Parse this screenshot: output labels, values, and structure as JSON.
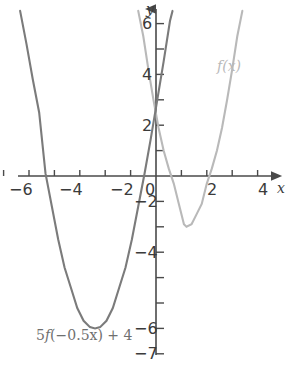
{
  "chart_data": {
    "type": "line",
    "title": "",
    "subtitle": "",
    "xlabel": "x",
    "ylabel": "y",
    "xlim": [
      -6.8,
      4.9
    ],
    "ylim": [
      -7.2,
      6.6
    ],
    "grid": false,
    "legend_position": "inline-annotation",
    "x_ticks": [
      -6,
      -5,
      -4,
      -3,
      -2,
      -1,
      0,
      1,
      2,
      3,
      4
    ],
    "x_tick_labels": [
      "−6",
      "",
      "−4",
      "",
      "−2",
      "",
      "0",
      "",
      "2",
      "",
      "4"
    ],
    "y_ticks": [
      -7,
      -6,
      -5,
      -4,
      -3,
      -2,
      -1,
      0,
      1,
      2,
      3,
      4,
      5,
      6
    ],
    "y_tick_labels": [
      "−7",
      "−6",
      "",
      "−4",
      "",
      "−2",
      "",
      "",
      "",
      "2",
      "",
      "4",
      "",
      "6"
    ],
    "annotations": [
      {
        "text": "f(x)",
        "x": 3.05,
        "y": 4.4,
        "color": "#b9b9b9"
      },
      {
        "text": "5f(−0.5x) + 4",
        "x": -4.1,
        "y": -6.6,
        "color": "#6f6f6f"
      }
    ],
    "series": [
      {
        "name": "f(x)",
        "color": "#b9b9b9",
        "equation": "y = 1.25(x - 1.2)^2 - 2",
        "vertex": [
          1.2,
          -2
        ],
        "x_intercepts": [
          -0.07,
          2.47
        ],
        "y_intercept": -0.2,
        "points": [
          [
            -0.7,
            6.5
          ],
          [
            -0.5,
            5.5
          ],
          [
            -0.3,
            4.2
          ],
          [
            -0.1,
            3.0
          ],
          [
            0.1,
            1.9
          ],
          [
            0.3,
            1.0
          ],
          [
            0.5,
            0.3
          ],
          [
            0.7,
            -0.3
          ],
          [
            0.9,
            -1.1
          ],
          [
            1.1,
            -1.9
          ],
          [
            1.2,
            -2.0
          ],
          [
            1.4,
            -1.9
          ],
          [
            1.6,
            -1.5
          ],
          [
            1.8,
            -1.1
          ],
          [
            2.0,
            -0.3
          ],
          [
            2.2,
            0.3
          ],
          [
            2.4,
            1.0
          ],
          [
            2.6,
            1.9
          ],
          [
            2.8,
            3.0
          ],
          [
            3.0,
            4.2
          ],
          [
            3.2,
            5.5
          ],
          [
            3.4,
            6.5
          ]
        ]
      },
      {
        "name": "5f(−0.5x) + 4",
        "color": "#7b7b7b",
        "equation": "y = 1.56(x + 2.4)^2 - 6",
        "vertex": [
          -2.4,
          -6
        ],
        "x_intercepts": [
          -4.36,
          -0.44
        ],
        "y_intercept": 3.0,
        "points": [
          [
            -5.35,
            6.5
          ],
          [
            -5.1,
            5.2
          ],
          [
            -4.85,
            3.8
          ],
          [
            -4.6,
            2.5
          ],
          [
            -4.35,
            0.1
          ],
          [
            -4.1,
            -1.2
          ],
          [
            -3.85,
            -2.5
          ],
          [
            -3.6,
            -3.6
          ],
          [
            -3.35,
            -4.4
          ],
          [
            -3.1,
            -5.2
          ],
          [
            -2.85,
            -5.7
          ],
          [
            -2.6,
            -5.95
          ],
          [
            -2.4,
            -6.0
          ],
          [
            -2.2,
            -5.95
          ],
          [
            -1.95,
            -5.7
          ],
          [
            -1.7,
            -5.2
          ],
          [
            -1.45,
            -4.4
          ],
          [
            -1.2,
            -3.6
          ],
          [
            -0.95,
            -2.5
          ],
          [
            -0.7,
            -1.2
          ],
          [
            -0.45,
            0.1
          ],
          [
            -0.2,
            1.5
          ],
          [
            0.05,
            3.0
          ],
          [
            0.3,
            4.5
          ],
          [
            0.55,
            6.1
          ],
          [
            0.65,
            6.5
          ]
        ]
      }
    ]
  },
  "axes": {
    "y_name": "y",
    "x_name": "x"
  },
  "labels": {
    "x": {
      "neg6": "−6",
      "neg4": "−4",
      "neg2": "−2",
      "zero": "0",
      "pos2": "2",
      "pos4": "4"
    },
    "y": {
      "pos6": "6",
      "pos4": "4",
      "pos2": "2",
      "neg2": "−2",
      "neg4": "−4",
      "neg6": "−6",
      "neg7": "−7"
    }
  },
  "curve_labels": {
    "light": "f(x)",
    "dark_prefix": "5",
    "dark_fn": "f",
    "dark_suffix": "(−0.5x) + 4"
  },
  "colors": {
    "light_curve": "#b9b9b9",
    "dark_curve": "#7b7b7b",
    "axis": "#4a4a4a",
    "text": "#3b3b3b"
  }
}
